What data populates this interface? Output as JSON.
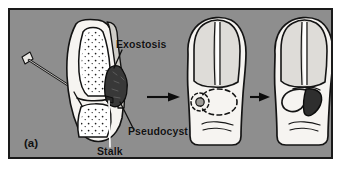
{
  "figure": {
    "panel_letter": "(a)",
    "domain": "medical-illustration",
    "background_color": "#8e8e8e",
    "border_color": "#1a1a1a",
    "ink_color": "#111111",
    "tissue_fill": "#f2f0ec",
    "bone_fill": "#ffffff",
    "nail_fill": "#d8d6d2",
    "exostosis_fill": "#3b3b3b",
    "flap_fill": "#2b2b2b"
  },
  "labels": {
    "exostosis": "Exostosis",
    "pseudocyst": "Pseudocyst",
    "stalk": "Stalk"
  },
  "panels": [
    {
      "id": "panel-1",
      "name": "lateral-cross-section",
      "description": "Lateral cross-section of distal phalanx with needle, exostosis and stalk"
    },
    {
      "id": "panel-2",
      "name": "dorsal-view-marked",
      "description": "Dorsal view of toe with dashed lesion outline and central punctum"
    },
    {
      "id": "panel-3",
      "name": "dorsal-view-flap",
      "description": "Dorsal view of toe with reflected surgical flap"
    }
  ],
  "arrows": [
    {
      "name": "arrow-stage-1-to-2",
      "direction": "right"
    },
    {
      "name": "arrow-stage-2-to-3",
      "direction": "right"
    }
  ]
}
